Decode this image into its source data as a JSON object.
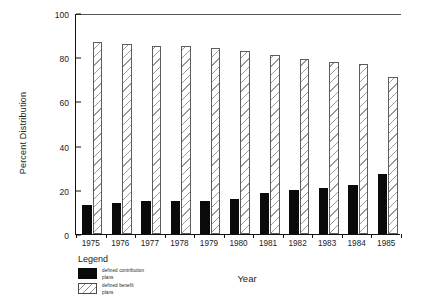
{
  "chart_data": {
    "type": "bar",
    "title": "",
    "xlabel": "Year",
    "ylabel": "Percent Distribution",
    "categories": [
      "1975",
      "1976",
      "1977",
      "1978",
      "1979",
      "1980",
      "1981",
      "1982",
      "1983",
      "1984",
      "1985"
    ],
    "series": [
      {
        "name": "defined contribution plans",
        "name_line1": "defined contribution",
        "name_line2": "plans",
        "style": "solid-black",
        "color": "#0a0a0a",
        "values": [
          13,
          14,
          15,
          15,
          15,
          16,
          18.5,
          20,
          21,
          22,
          27
        ]
      },
      {
        "name": "defined benefit plans",
        "name_line1": "defined benefit",
        "name_line2": "plans",
        "style": "hatched-white",
        "color": "#ffffff",
        "values": [
          87,
          86,
          85,
          85,
          84,
          83,
          81,
          79,
          78,
          77,
          71
        ]
      }
    ],
    "ylim": [
      0,
      100
    ],
    "yticks": [
      0,
      20,
      40,
      60,
      80,
      100
    ],
    "ytick_labels": [
      "0",
      "20",
      "40",
      "60",
      "80",
      "100"
    ],
    "grid": false,
    "legend_position": "below-plot-left"
  },
  "legend": {
    "title": "Legend"
  }
}
